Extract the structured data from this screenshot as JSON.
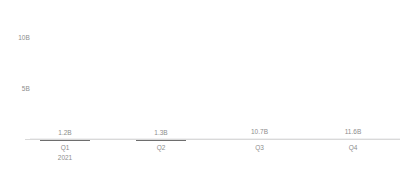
{
  "chart_data": {
    "type": "bar",
    "title": "",
    "subtitle": "",
    "xlabel": "",
    "ylabel": "",
    "categories": [
      "Q1",
      "Q2",
      "Q3",
      "Q4"
    ],
    "category_sublabels": [
      "2021",
      "",
      "",
      ""
    ],
    "values": [
      1.2,
      1.3,
      10.7,
      11.6
    ],
    "value_labels": [
      "1.2B",
      "1.3B",
      "10.7B",
      "11.6B"
    ],
    "ylim": [
      0,
      13
    ],
    "yticks": [
      5,
      10
    ],
    "ytick_labels": [
      "5B",
      "10B"
    ],
    "grid": true,
    "legend": false,
    "bar_color": "#6e6e6e",
    "gridline_color": "#f0f0f1",
    "axis_color": "#d9d9d9",
    "text_color": "#8d8d8d"
  }
}
